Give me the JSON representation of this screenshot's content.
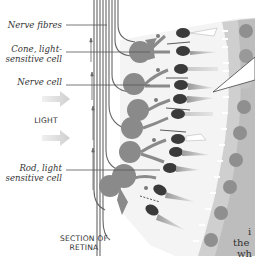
{
  "diagram": {
    "title": "SECTION OF RETINA",
    "title_lines": [
      "SECTION OF",
      "RETINA"
    ],
    "light_label": "LIGHT",
    "labels": [
      {
        "id": "nerve-fibres",
        "line1": "Nerve fibres",
        "line2": ""
      },
      {
        "id": "cone",
        "line1": "Cone, light-",
        "line2": "sensitive cell"
      },
      {
        "id": "nerve-cell",
        "line1": "Nerve cell",
        "line2": ""
      },
      {
        "id": "rod",
        "line1": "Rod, light",
        "line2": "sensitive cell"
      }
    ],
    "cropped_text_fragments": [
      "i",
      "the",
      "wh"
    ],
    "colors": {
      "cell_gray": "#8a8a8a",
      "dark_nucleus": "#3a3a3a",
      "pigment_layer": "#c8c8c8",
      "pigment_nucleus": "#8f8f8f",
      "light_arrow": "#d6d6d6",
      "line": "#555555",
      "background": "#ffffff"
    }
  }
}
